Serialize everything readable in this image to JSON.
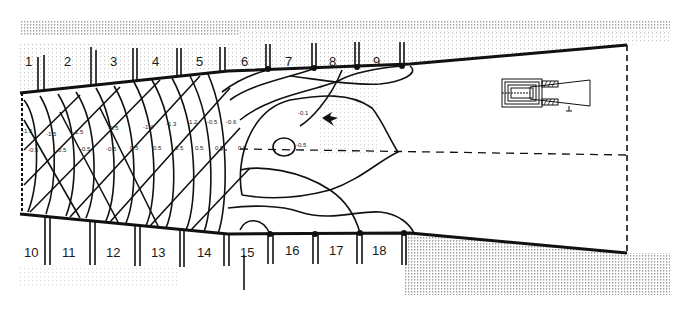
{
  "figure": {
    "type": "duct-flow-contour-diagram",
    "top_sections": [
      "1",
      "2",
      "3",
      "4",
      "5",
      "6",
      "7",
      "8",
      "9"
    ],
    "bottom_sections": [
      "10",
      "11",
      "12",
      "13",
      "14",
      "15",
      "16",
      "17",
      "18"
    ],
    "contour_labels_upper": [
      "-1.5",
      "-1.5",
      "-1.5",
      "-1.5",
      "-1.4",
      "-1.3",
      "-1.2",
      "-0.5",
      "-0.6"
    ],
    "contour_labels_lower": [
      "-0.5",
      "-0.5",
      "-0.5",
      "-0.5",
      "0.5",
      "0.5",
      "0.5",
      "0.5",
      "0.5",
      "0.5"
    ],
    "inner_labels": {
      "center_contour": "-0.1",
      "eye_label": "-0.5",
      "left_center": "0.5"
    },
    "colors": {
      "ink": "#111111",
      "background": "#ffffff",
      "halftone": "#9a9a9a"
    }
  }
}
